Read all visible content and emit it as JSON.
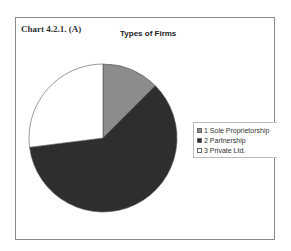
{
  "chart_label": "Chart 4.2.1. (A)",
  "chart_data": {
    "type": "pie",
    "title": "Types of Firms",
    "categories": [
      "1 Sole Proprietorship",
      "2 Partnership",
      "3 Private Ltd."
    ],
    "values": [
      12.5,
      60.5,
      27.0
    ],
    "colors": [
      "#8c8c8c",
      "#2e2e2e",
      "#ffffff"
    ],
    "legend_position": "right"
  },
  "legend": [
    {
      "label": "1 Sole Proprietorship",
      "color": "#8c8c8c"
    },
    {
      "label": "2 Partnership",
      "color": "#2e2e2e"
    },
    {
      "label": "3 Private Ltd.",
      "color": "#ffffff"
    }
  ]
}
